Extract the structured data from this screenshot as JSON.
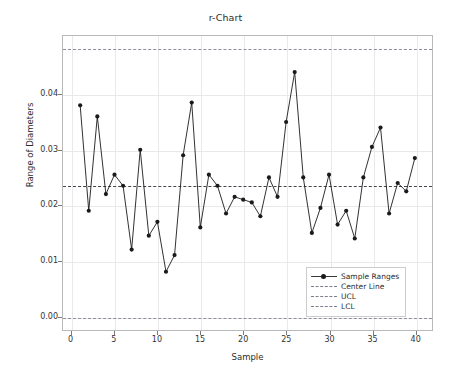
{
  "chart_data": {
    "type": "line",
    "title": "r-Chart",
    "xlabel": "Sample",
    "ylabel": "Range of Diameters",
    "xlim": [
      -1,
      42
    ],
    "ylim": [
      -0.0025,
      0.0505
    ],
    "xticks": [
      0,
      5,
      10,
      15,
      20,
      25,
      30,
      35,
      40
    ],
    "yticks": [
      0.0,
      0.01,
      0.02,
      0.03,
      0.04
    ],
    "ytick_labels": [
      "0.00",
      "0.01",
      "0.02",
      "0.03",
      "0.04"
    ],
    "grid": true,
    "legend_position": "lower right",
    "x": [
      1,
      2,
      3,
      4,
      5,
      6,
      7,
      8,
      9,
      10,
      11,
      12,
      13,
      14,
      15,
      16,
      17,
      18,
      19,
      20,
      21,
      22,
      23,
      24,
      25,
      26,
      27,
      28,
      29,
      30,
      31,
      32,
      33,
      34,
      35,
      36,
      37,
      38,
      39,
      40
    ],
    "series": [
      {
        "name": "Sample Ranges",
        "marker": "o",
        "color": "#1a1a1a",
        "values": [
          0.038,
          0.019,
          0.036,
          0.022,
          0.0255,
          0.0235,
          0.012,
          0.03,
          0.0145,
          0.017,
          0.008,
          0.011,
          0.029,
          0.0385,
          0.016,
          0.0255,
          0.0235,
          0.0185,
          0.0215,
          0.021,
          0.0205,
          0.018,
          0.025,
          0.0215,
          0.035,
          0.044,
          0.025,
          0.015,
          0.0195,
          0.0255,
          0.0165,
          0.019,
          0.014,
          0.025,
          0.0305,
          0.034,
          0.0185,
          0.024,
          0.0225,
          0.0285
        ]
      }
    ],
    "reference_lines": [
      {
        "name": "Center Line",
        "value": 0.0237,
        "style": "dashed",
        "color": "#44444f"
      },
      {
        "name": "UCL",
        "value": 0.0481,
        "style": "dashed",
        "color": "#8e8ea0"
      },
      {
        "name": "LCL",
        "value": 0.0,
        "style": "dashed",
        "color": "#8e8ea0"
      }
    ],
    "legend": [
      {
        "label": "Sample Ranges",
        "symbol": "line-marker"
      },
      {
        "label": "Center Line",
        "symbol": "dashed-line"
      },
      {
        "label": "UCL",
        "symbol": "dashed-line"
      },
      {
        "label": "LCL",
        "symbol": "dashed-line"
      }
    ]
  }
}
